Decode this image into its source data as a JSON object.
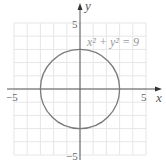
{
  "chart_data": {
    "type": "line",
    "title": "",
    "xlabel": "x",
    "ylabel": "y",
    "xlim": [
      -5,
      5
    ],
    "ylim": [
      -5,
      5
    ],
    "grid": true,
    "x_tick_labels": [
      "-5",
      "5"
    ],
    "y_tick_labels": [
      "5",
      "-5"
    ],
    "series": [
      {
        "name": "x^2 + y^2 = 9",
        "shape": "circle",
        "center": [
          0,
          0
        ],
        "radius": 3,
        "color": "#7a7a7a"
      }
    ],
    "annotations": [
      {
        "text": "x² + y² = 9",
        "x": 2.3,
        "y": 3.7
      }
    ]
  },
  "labels": {
    "x_axis": "x",
    "y_axis": "y",
    "x_min": "−5",
    "x_max": "5",
    "y_max": "5",
    "y_min": "−5",
    "equation": "x² + y² = 9"
  },
  "colors": {
    "grid": "#e6e6e6",
    "axis": "#555555",
    "curve": "#7a7a7a"
  }
}
